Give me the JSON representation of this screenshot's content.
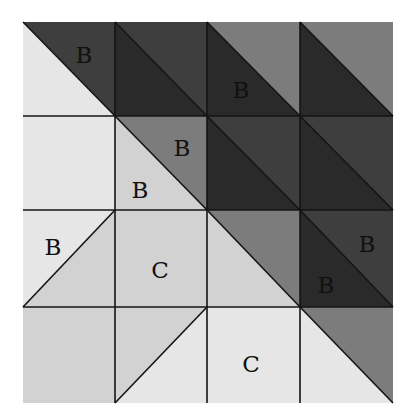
{
  "diagram": {
    "grid": {
      "rows": 4,
      "cols": 4,
      "x_lines": [
        23,
        115,
        207,
        300,
        393
      ],
      "y_lines": [
        22,
        116,
        210,
        307,
        403
      ],
      "line_color": "#141414"
    },
    "colors": {
      "very_light": "#e6e6e6",
      "light": "#d2d2d2",
      "medium": "#7c7c7c",
      "dark": "#3e3e3e",
      "darkest": "#2a2a2a"
    },
    "cells": [
      {
        "row": 0,
        "col": 0,
        "split": "tl-br",
        "upper": "dark",
        "lower": "very_light"
      },
      {
        "row": 0,
        "col": 1,
        "split": "tl-br",
        "upper": "dark",
        "lower": "darkest"
      },
      {
        "row": 0,
        "col": 2,
        "split": "tl-br",
        "upper": "medium",
        "lower": "darkest"
      },
      {
        "row": 0,
        "col": 3,
        "split": "tl-br",
        "upper": "medium",
        "lower": "darkest"
      },
      {
        "row": 1,
        "col": 0,
        "split": "none",
        "fill": "very_light"
      },
      {
        "row": 1,
        "col": 1,
        "split": "tl-br",
        "upper": "medium",
        "lower": "light"
      },
      {
        "row": 1,
        "col": 2,
        "split": "tl-br",
        "upper": "dark",
        "lower": "darkest"
      },
      {
        "row": 1,
        "col": 3,
        "split": "tl-br",
        "upper": "dark",
        "lower": "darkest"
      },
      {
        "row": 2,
        "col": 0,
        "split": "bl-tr",
        "upper": "very_light",
        "lower": "light"
      },
      {
        "row": 2,
        "col": 1,
        "split": "none",
        "fill": "light"
      },
      {
        "row": 2,
        "col": 2,
        "split": "tl-br",
        "upper": "medium",
        "lower": "light"
      },
      {
        "row": 2,
        "col": 3,
        "split": "tl-br",
        "upper": "dark",
        "lower": "darkest"
      },
      {
        "row": 3,
        "col": 0,
        "split": "none",
        "fill": "light"
      },
      {
        "row": 3,
        "col": 1,
        "split": "bl-tr",
        "upper": "light",
        "lower": "very_light"
      },
      {
        "row": 3,
        "col": 2,
        "split": "none",
        "fill": "very_light"
      },
      {
        "row": 3,
        "col": 3,
        "split": "tl-br",
        "upper": "medium",
        "lower": "very_light"
      }
    ],
    "labels": [
      {
        "text": "B",
        "x": 84,
        "y": 57
      },
      {
        "text": "B",
        "x": 241,
        "y": 92
      },
      {
        "text": "B",
        "x": 182,
        "y": 150
      },
      {
        "text": "B",
        "x": 140,
        "y": 192
      },
      {
        "text": "B",
        "x": 53,
        "y": 249
      },
      {
        "text": "C",
        "x": 160,
        "y": 272
      },
      {
        "text": "B",
        "x": 367,
        "y": 246
      },
      {
        "text": "B",
        "x": 326,
        "y": 287
      },
      {
        "text": "C",
        "x": 251,
        "y": 366
      }
    ]
  }
}
